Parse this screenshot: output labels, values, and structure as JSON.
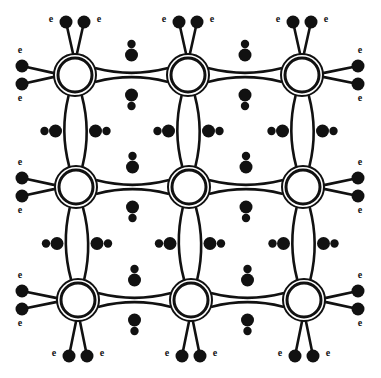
{
  "figure": {
    "background_color": "#ffffff",
    "ink_color": "#111111",
    "width": 381,
    "height": 378
  },
  "lattice": {
    "rows": 3,
    "columns": 3,
    "core_radius_outer": 21,
    "core_radius_inner": 17,
    "core_centers": [
      {
        "id": "core-r1c1",
        "x": 75,
        "y": 75
      },
      {
        "id": "core-r1c2",
        "x": 188,
        "y": 75
      },
      {
        "id": "core-r1c3",
        "x": 302,
        "y": 75
      },
      {
        "id": "core-r2c1",
        "x": 76,
        "y": 187
      },
      {
        "id": "core-r2c2",
        "x": 189,
        "y": 187
      },
      {
        "id": "core-r2c3",
        "x": 303,
        "y": 187
      },
      {
        "id": "core-r3c1",
        "x": 78,
        "y": 300
      },
      {
        "id": "core-r3c2",
        "x": 191,
        "y": 300
      },
      {
        "id": "core-r3c3",
        "x": 304,
        "y": 300
      }
    ],
    "grid_spacing_x": 113,
    "grid_spacing_y": 112,
    "bond_bow": 9,
    "bond_stroke_width": 2.6
  },
  "electron_dots": {
    "radius_large": 6.5,
    "radius_small": 4.2,
    "color": "#111111",
    "pair_offset": 11
  },
  "labels": {
    "electron_symbol": "e",
    "font_size": 10
  },
  "edge_labels": {
    "top": [
      "e",
      "e",
      "e",
      "e",
      "e",
      "e"
    ],
    "bottom": [
      "e",
      "e",
      "e",
      "e",
      "e",
      "e"
    ],
    "left": [
      "e",
      "e",
      "e",
      "e",
      "e",
      "e"
    ],
    "right": [
      "e",
      "e",
      "e",
      "e",
      "e",
      "e"
    ]
  },
  "chart_data": {
    "type": "diagram",
    "cores": 9,
    "bonds_internal_horizontal": 6,
    "bonds_internal_vertical": 6,
    "dangling_bonds": 24,
    "electron_label": "e",
    "legend": []
  }
}
